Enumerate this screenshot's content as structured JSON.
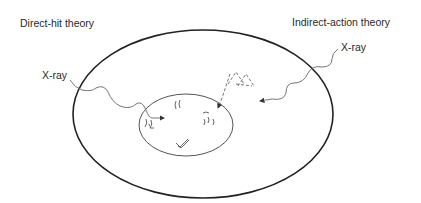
{
  "diagram": {
    "left_title": "Direct-hit theory",
    "right_title": "Indirect-action theory",
    "left_ray_label": "X-ray",
    "right_ray_label": "X-ray",
    "parts": {
      "outer": "cell-membrane",
      "inner": "nucleus",
      "left_ray": "x-ray-direct-hit-path",
      "right_ray": "x-ray-indirect-path",
      "radicals": "free-radical-dashed-shapes",
      "dna": "dna-fragments"
    },
    "colors": {
      "outline": "#222222",
      "ray": "#555555",
      "text": "#2a2a2a"
    }
  }
}
